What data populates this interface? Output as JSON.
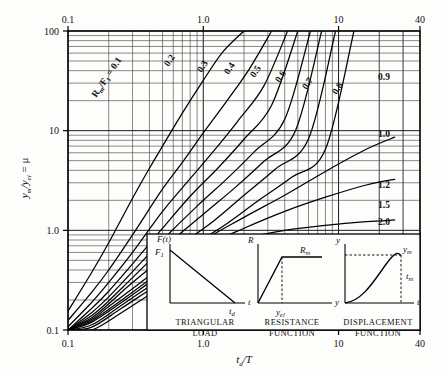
{
  "figure": {
    "title": "",
    "x_axis": {
      "label": "t_d/T",
      "label_html": "t",
      "label_sub": "d",
      "label_tail": "/T",
      "ticks": [
        "0.1",
        "1.0",
        "10",
        "40"
      ],
      "min": 0.1,
      "max": 40,
      "scale": "log"
    },
    "y_axis": {
      "label": "y_m/y_el = μ",
      "ticks": [
        "0.1",
        "1.0",
        "10",
        "100"
      ],
      "min": 0.1,
      "max": 100,
      "scale": "log"
    },
    "curve_family_label": "R_m/F_1 = 0.1",
    "curve_labels_top": [
      "0.2",
      "0.3",
      "0.4",
      "0.5",
      "0.6",
      "0.7",
      "0.8"
    ],
    "curve_labels_right": [
      "0.9",
      "1.0",
      "1.2",
      "1.5",
      "2.0"
    ]
  },
  "chart_data": {
    "type": "line",
    "xlabel": "t_d/T",
    "ylabel": "y_m/y_el = μ",
    "xscale": "log",
    "yscale": "log",
    "xlim": [
      0.1,
      40
    ],
    "ylim": [
      0.1,
      100
    ],
    "grid": true,
    "legend": "inline-curve-labels",
    "xticks": [
      0.1,
      1.0,
      10,
      40
    ],
    "yticks": [
      0.1,
      1.0,
      10,
      100
    ],
    "annotations": [
      "R_m/F_1 = 0.1",
      "TRIANGULAR LOAD",
      "RESISTANCE FUNCTION",
      "DISPLACEMENT FUNCTION"
    ],
    "series": [
      {
        "name": "0.1",
        "label_pos": "upper-left-diagonal",
        "x": [
          0.1,
          0.15,
          0.2,
          0.3,
          0.4,
          0.5,
          0.7,
          1.0,
          1.4,
          2.0
        ],
        "y": [
          0.155,
          0.38,
          0.75,
          2.1,
          4.2,
          7.0,
          15.0,
          32.0,
          62.0,
          100.0
        ]
      },
      {
        "name": "0.2",
        "label_pos": "top",
        "x": [
          0.1,
          0.15,
          0.2,
          0.3,
          0.5,
          0.7,
          1.0,
          1.5,
          2.2,
          3.2
        ],
        "y": [
          0.125,
          0.24,
          0.4,
          0.9,
          2.6,
          4.8,
          9.5,
          20.0,
          42.0,
          100.0
        ]
      },
      {
        "name": "0.3",
        "label_pos": "top",
        "x": [
          0.1,
          0.15,
          0.2,
          0.3,
          0.5,
          0.8,
          1.2,
          1.8,
          2.8,
          4.2
        ],
        "y": [
          0.108,
          0.19,
          0.3,
          0.6,
          1.55,
          3.3,
          6.3,
          12.5,
          28.0,
          100.0
        ]
      },
      {
        "name": "0.4",
        "label_pos": "top",
        "x": [
          0.1,
          0.15,
          0.2,
          0.3,
          0.5,
          0.8,
          1.3,
          2.0,
          3.2,
          5.0
        ],
        "y": [
          0.1,
          0.165,
          0.245,
          0.46,
          1.05,
          2.2,
          4.3,
          8.2,
          18.0,
          100.0
        ]
      },
      {
        "name": "0.5",
        "label_pos": "top",
        "x": [
          0.1,
          0.15,
          0.2,
          0.3,
          0.5,
          0.9,
          1.5,
          2.4,
          4.0,
          6.2
        ],
        "y": [
          0.095,
          0.15,
          0.215,
          0.385,
          0.8,
          1.75,
          3.3,
          6.2,
          13.0,
          100.0
        ]
      },
      {
        "name": "0.6",
        "label_pos": "top",
        "x": [
          0.1,
          0.15,
          0.2,
          0.3,
          0.5,
          1.0,
          1.7,
          2.8,
          4.8,
          7.5
        ],
        "y": [
          0.092,
          0.14,
          0.196,
          0.335,
          0.655,
          1.45,
          2.65,
          4.9,
          10.0,
          100.0
        ]
      },
      {
        "name": "0.7",
        "label_pos": "top",
        "x": [
          0.1,
          0.15,
          0.2,
          0.3,
          0.6,
          1.2,
          2.0,
          3.4,
          6.0,
          9.5
        ],
        "y": [
          0.09,
          0.133,
          0.183,
          0.3,
          0.63,
          1.25,
          2.25,
          4.1,
          8.3,
          100.0
        ]
      },
      {
        "name": "0.8",
        "label_pos": "top",
        "x": [
          0.1,
          0.15,
          0.2,
          0.35,
          0.7,
          1.4,
          2.5,
          4.5,
          8.0,
          13.0
        ],
        "y": [
          0.088,
          0.128,
          0.172,
          0.305,
          0.615,
          1.1,
          1.95,
          3.4,
          6.5,
          100.0
        ]
      },
      {
        "name": "0.9",
        "label_pos": "right",
        "x": [
          0.1,
          0.15,
          0.25,
          0.5,
          1.0,
          2.0,
          4.0,
          8.0,
          16.0,
          26.0
        ],
        "y": [
          0.086,
          0.124,
          0.2,
          0.4,
          0.79,
          1.35,
          2.25,
          3.9,
          6.5,
          8.6
        ]
      },
      {
        "name": "1.0",
        "label_pos": "right",
        "x": [
          0.1,
          0.15,
          0.25,
          0.5,
          1.0,
          2.0,
          4.0,
          8.0,
          16.0,
          26.0
        ],
        "y": [
          0.084,
          0.12,
          0.19,
          0.37,
          0.68,
          1.05,
          1.55,
          2.15,
          2.85,
          3.25
        ]
      },
      {
        "name": "1.2",
        "label_pos": "right",
        "x": [
          0.1,
          0.15,
          0.25,
          0.5,
          1.0,
          2.0,
          4.0,
          8.0,
          16.0,
          26.0
        ],
        "y": [
          0.08,
          0.113,
          0.178,
          0.335,
          0.58,
          0.82,
          1.0,
          1.12,
          1.22,
          1.27
        ]
      },
      {
        "name": "1.5",
        "label_pos": "right",
        "x": [
          0.1,
          0.15,
          0.25,
          0.5,
          1.0,
          2.0,
          4.0,
          8.0,
          16.0,
          26.0
        ],
        "y": [
          0.076,
          0.107,
          0.166,
          0.305,
          0.51,
          0.68,
          0.79,
          0.85,
          0.89,
          0.905
        ]
      },
      {
        "name": "2.0",
        "label_pos": "right",
        "x": [
          0.1,
          0.15,
          0.25,
          0.5,
          1.0,
          2.0,
          4.0,
          8.0,
          16.0,
          26.0
        ],
        "y": [
          0.07,
          0.098,
          0.15,
          0.272,
          0.44,
          0.57,
          0.64,
          0.675,
          0.695,
          0.7
        ]
      }
    ]
  },
  "insets": [
    {
      "id": "triangular-load",
      "caption_line1": "TRIANGULAR",
      "caption_line2": "LOAD",
      "y_axis_symbol": "F(t)",
      "peak_symbol": "F",
      "peak_sub": "1",
      "x_end_symbol": "t",
      "x_end_sub": "d",
      "x_axis_symbol": "t"
    },
    {
      "id": "resistance-function",
      "caption_line1": "RESISTANCE",
      "caption_line2": "FUNCTION",
      "y_axis_symbol": "R",
      "plateau_symbol": "R",
      "plateau_sub": "m",
      "yield_symbol": "y",
      "yield_sub": "el",
      "x_axis_symbol": "y"
    },
    {
      "id": "displacement-function",
      "caption_line1": "DISPLACEMENT",
      "caption_line2": "FUNCTION",
      "y_axis_symbol": "y",
      "peak_symbol": "y",
      "peak_sub": "m",
      "time_symbol": "t",
      "time_sub": "m",
      "x_axis_symbol": "t"
    }
  ]
}
